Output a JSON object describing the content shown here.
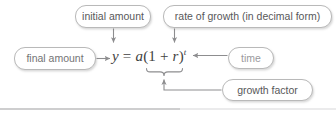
{
  "diagram": {
    "title": "Exponential growth formula annotated diagram",
    "formula": {
      "full": "y = a(1 + r)^t",
      "lhs": "y",
      "equals": " = ",
      "coefficient": "a",
      "open_paren": "(",
      "one": "1",
      "plus": " + ",
      "rate": "r",
      "close_paren": ")",
      "exponent": "t"
    },
    "callouts": [
      {
        "id": "initial-amount",
        "label": "initial amount",
        "points_to": "a"
      },
      {
        "id": "rate-of-growth",
        "label": "rate of growth (in decimal form)",
        "points_to": "r"
      },
      {
        "id": "final-amount",
        "label": "final amount",
        "points_to": "y"
      },
      {
        "id": "time",
        "label": "time",
        "points_to": "t"
      },
      {
        "id": "growth-factor",
        "label": "growth factor",
        "points_to": "(1 + r)"
      }
    ],
    "colors": {
      "box_border": "#b9b9b9",
      "box_fill": "#ffffff",
      "text": "#58585a",
      "formula_text": "#3f3f41",
      "arrow": "#8d8d8f",
      "rule": "#9d9d9f"
    }
  }
}
